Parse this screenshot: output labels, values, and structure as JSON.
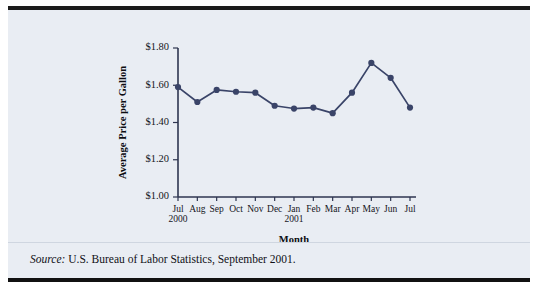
{
  "chart_data": {
    "type": "line",
    "title": "",
    "xlabel": "Month",
    "ylabel": "Average Price per Gallon",
    "categories": [
      "Jul",
      "Aug",
      "Sep",
      "Oct",
      "Nov",
      "Dec",
      "Jan",
      "Feb",
      "Mar",
      "Apr",
      "May",
      "Jun",
      "Jul"
    ],
    "year_labels": [
      {
        "category": "Jul",
        "index": 0,
        "text": "2000"
      },
      {
        "category": "Jan",
        "index": 6,
        "text": "2001"
      }
    ],
    "values": [
      1.59,
      1.51,
      1.575,
      1.565,
      1.56,
      1.49,
      1.475,
      1.48,
      1.45,
      1.56,
      1.72,
      1.64,
      1.48
    ],
    "ylim": [
      1.0,
      1.8
    ],
    "ytick_values": [
      1.0,
      1.2,
      1.4,
      1.6,
      1.8
    ],
    "ytick_labels": [
      "$1.00",
      "$1.20",
      "$1.40",
      "$1.60",
      "$1.80"
    ],
    "grid": false,
    "legend": false,
    "series_color": "#3a4468",
    "plot_background": "#e9edf3"
  },
  "source": {
    "label": "Source:",
    "text": " U.S. Bureau of Labor Statistics, September 2001."
  }
}
